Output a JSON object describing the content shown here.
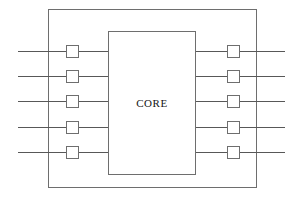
{
  "diagram": {
    "type": "block-diagram",
    "canvas": {
      "width": 294,
      "height": 200,
      "background": "#ffffff"
    },
    "colors": {
      "outline": "#6e6e6e",
      "route": "#585858",
      "label_text": "#151515",
      "fill": "#ffffff"
    },
    "die": {
      "label": "die-boundary",
      "x": 48,
      "y": 9,
      "width": 209,
      "height": 179
    },
    "core": {
      "label": "CORE",
      "x": 108,
      "y": 31,
      "width": 88,
      "height": 144
    },
    "rows": [
      {
        "id": "row-1",
        "y": 51
      },
      {
        "id": "row-2",
        "y": 76
      },
      {
        "id": "row-3",
        "y": 101
      },
      {
        "id": "row-4",
        "y": 127
      },
      {
        "id": "row-5",
        "y": 152
      }
    ],
    "pads": {
      "size": 13,
      "left_x": 66,
      "right_x": 227,
      "left_count": 5,
      "right_count": 5
    },
    "routes": {
      "left_outer_start_x": 18,
      "left_inner_end_x": 108,
      "right_inner_start_x": 196,
      "right_outer_end_x": 285
    }
  }
}
